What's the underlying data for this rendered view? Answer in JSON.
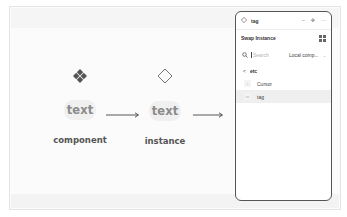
{
  "canvas": {
    "colors": {
      "frame_bg": "#fbfbfb",
      "pill_bg": "#f0f0f0",
      "pill_text": "#8b8b8b",
      "label_text": "#555555",
      "icon_fill": "#555555",
      "panel_border": "#555555"
    },
    "nodes": [
      {
        "icon": "component-diamond-icon",
        "pill_text": "text",
        "label": "component"
      },
      {
        "icon": "instance-diamond-outline-icon",
        "pill_text": "text",
        "label": "instance"
      }
    ],
    "arrows": [
      {
        "icon": "arrow-right-icon"
      },
      {
        "icon": "arrow-right-icon"
      }
    ]
  },
  "panel": {
    "topbar": {
      "icon": "instance-diamond-outline-icon",
      "title": "tag",
      "buttons": [
        {
          "icon": "minus-icon",
          "glyph": "–"
        },
        {
          "icon": "target-icon",
          "glyph": "✥"
        },
        {
          "icon": "more-icon",
          "glyph": "···"
        }
      ]
    },
    "swap": {
      "title": "Swap Instance",
      "view_toggle_icon": "grid-view-icon"
    },
    "search": {
      "icon": "search-icon",
      "placeholder": "Search",
      "value": "",
      "library_select": "Local comp...",
      "library_chevron": "⌄"
    },
    "breadcrumb": {
      "back_glyph": "<",
      "label": "etc"
    },
    "items": [
      {
        "label": "Cursor",
        "thumb": "▫",
        "selected": false
      },
      {
        "label": "tag",
        "thumb": "▭",
        "selected": true
      }
    ]
  }
}
